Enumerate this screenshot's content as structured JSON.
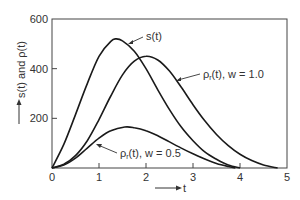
{
  "chart_data": {
    "type": "line",
    "title": "",
    "xlabel": "t",
    "ylabel": "s(t) and ρ(t)",
    "xlim": [
      0,
      5
    ],
    "ylim": [
      0,
      600
    ],
    "xticks": [
      0,
      1,
      2,
      3,
      4,
      5
    ],
    "yticks": [
      200,
      400,
      600
    ],
    "xtick_labels": [
      "0",
      "1",
      "2",
      "3",
      "4",
      "5"
    ],
    "ytick_labels": [
      "200",
      "400",
      "600"
    ],
    "grid": false,
    "legend": "none (inline annotations with leader lines)",
    "series": [
      {
        "name": "s(t)",
        "label": "s(t)",
        "x": [
          0,
          0.25,
          0.5,
          0.75,
          1.0,
          1.25,
          1.36,
          1.5,
          1.75,
          2.0,
          2.25,
          2.5,
          2.75,
          3.0,
          3.25,
          3.5,
          3.75,
          4.0
        ],
        "y": [
          0,
          95,
          215,
          340,
          450,
          510,
          520,
          512,
          470,
          400,
          315,
          235,
          165,
          110,
          65,
          35,
          12,
          0
        ]
      },
      {
        "name": "rho_r(t), w = 1.0",
        "label": "ρr(t), w = 1.0",
        "x": [
          0,
          0.25,
          0.5,
          0.75,
          1.0,
          1.25,
          1.5,
          1.75,
          2.0,
          2.25,
          2.5,
          2.75,
          3.0,
          3.25,
          3.5,
          3.75,
          4.0,
          4.25,
          4.5,
          4.8
        ],
        "y": [
          0,
          15,
          50,
          110,
          195,
          290,
          375,
          430,
          450,
          435,
          390,
          325,
          255,
          190,
          135,
          90,
          55,
          30,
          12,
          0
        ]
      },
      {
        "name": "rho_r(t), w = 0.5",
        "label": "ρr(t), w = 0.5",
        "x": [
          0,
          0.25,
          0.5,
          0.75,
          1.0,
          1.25,
          1.55,
          1.75,
          2.0,
          2.25,
          2.5,
          2.75,
          3.0,
          3.25,
          3.5,
          3.75,
          3.9
        ],
        "y": [
          0,
          12,
          40,
          80,
          120,
          150,
          165,
          162,
          150,
          130,
          105,
          80,
          57,
          36,
          18,
          6,
          0
        ]
      }
    ],
    "annotations": [
      {
        "text": "s(t)",
        "series": "s(t)"
      },
      {
        "text": "ρr(t), w = 1.0",
        "series": "rho_r(t), w = 1.0"
      },
      {
        "text": "ρr(t), w = 0.5",
        "series": "rho_r(t), w = 0.5"
      }
    ]
  },
  "labels": {
    "y_axis_title": "—→ s(t) and ρ(t)",
    "y_axis_text": "s(t) and ρ(t)",
    "x_axis_text": "t",
    "ann_s": "s(t)",
    "ann_w1_rho": "ρ",
    "ann_w1_sub": "r",
    "ann_w1_rest": "(t), w = 1.0",
    "ann_w05_rho": "ρ",
    "ann_w05_sub": "r",
    "ann_w05_rest": "(t), w = 0.5"
  }
}
